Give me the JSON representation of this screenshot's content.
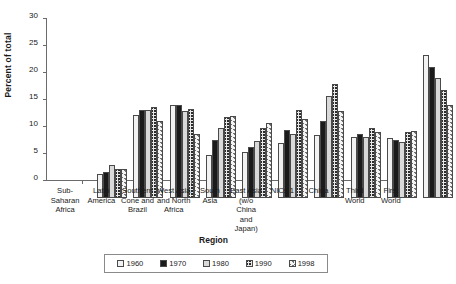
{
  "chart_data": {
    "type": "bar",
    "title": "",
    "xlabel": "Region",
    "ylabel": "Percent of total",
    "ylim": [
      0,
      30
    ],
    "yticks": [
      0,
      5,
      10,
      15,
      20,
      25,
      30
    ],
    "grid": false,
    "legend_position": "bottom",
    "categories": [
      "Sub-\nSaharan\nAfrica",
      "Latin\nAmerica",
      "Southern\nCone and\nBrazil",
      "West Asia\nand North\nAfrica",
      "South\nAsia",
      "East Asia\n(w/o China\nand\nJapan)",
      "NICs 1",
      "China",
      "Third\nWorld",
      "First World"
    ],
    "series": [
      {
        "name": "1960",
        "pattern": "light-dotted",
        "values": [
          4.5,
          15.4,
          17.3,
          7.9,
          8.6,
          10.1,
          11.7,
          11.3,
          11.2,
          26.4
        ]
      },
      {
        "name": "1970",
        "pattern": "solid-black",
        "values": [
          4.8,
          16.3,
          17.2,
          10.7,
          9.4,
          12.6,
          14.2,
          11.9,
          10.7,
          24.2
        ]
      },
      {
        "name": "1980",
        "pattern": "light-gray",
        "values": [
          6.1,
          16.3,
          16.1,
          12.9,
          10.6,
          11.9,
          18.9,
          11.3,
          10.4,
          22.2
        ]
      },
      {
        "name": "1990",
        "pattern": "dark-crosshatch",
        "values": [
          5.4,
          16.8,
          16.5,
          15.0,
          12.9,
          16.3,
          21.1,
          13.0,
          12.2,
          20.0
        ]
      },
      {
        "name": "1998",
        "pattern": "light-diagonal-hatch",
        "values": [
          5.4,
          14.2,
          11.8,
          15.2,
          13.8,
          14.6,
          16.1,
          12.3,
          12.5,
          17.2
        ]
      }
    ]
  }
}
